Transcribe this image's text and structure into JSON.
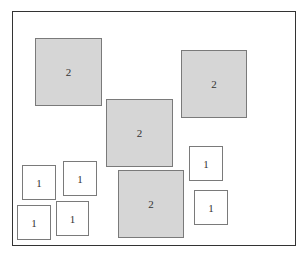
{
  "diagram": {
    "frame": {
      "x": 12,
      "y": 11,
      "w": 284,
      "h": 235
    },
    "boxes": [
      {
        "label": "2",
        "kind": "big",
        "x": 35,
        "y": 38,
        "w": 67,
        "h": 68
      },
      {
        "label": "2",
        "kind": "big",
        "x": 181,
        "y": 50,
        "w": 66,
        "h": 68
      },
      {
        "label": "2",
        "kind": "big",
        "x": 106,
        "y": 99,
        "w": 67,
        "h": 68
      },
      {
        "label": "2",
        "kind": "big",
        "x": 118,
        "y": 170,
        "w": 66,
        "h": 68
      },
      {
        "label": "1",
        "kind": "small",
        "x": 22,
        "y": 165,
        "w": 34,
        "h": 35
      },
      {
        "label": "1",
        "kind": "small",
        "x": 63,
        "y": 161,
        "w": 34,
        "h": 35
      },
      {
        "label": "1",
        "kind": "small",
        "x": 17,
        "y": 205,
        "w": 34,
        "h": 35
      },
      {
        "label": "1",
        "kind": "small",
        "x": 56,
        "y": 201,
        "w": 33,
        "h": 35
      },
      {
        "label": "1",
        "kind": "small",
        "x": 189,
        "y": 146,
        "w": 34,
        "h": 35
      },
      {
        "label": "1",
        "kind": "small",
        "x": 194,
        "y": 190,
        "w": 34,
        "h": 35
      }
    ],
    "colors": {
      "big_fill": "#d6d6d6",
      "small_fill": "#ffffff",
      "border": "#7a7a7a",
      "frame": "#333333"
    }
  }
}
